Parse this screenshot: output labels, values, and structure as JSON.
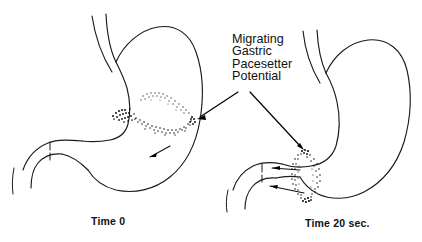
{
  "figure": {
    "name": "migrating-gastric-pacesetter-potential",
    "background_color": "#ffffff",
    "ink_color": "#111111",
    "width": 422,
    "height": 242
  },
  "annotation": {
    "lines": [
      "Migrating",
      "Gastric",
      "Pacesetter",
      "Potential"
    ],
    "line1": "Migrating",
    "line2": "Gastric",
    "line3": "Pacesetter",
    "line4": "Potential",
    "x": 232,
    "y_start": 43,
    "line_height": 12.4
  },
  "captions": {
    "left": "Time 0",
    "right": "Time 20 sec."
  },
  "panels": [
    {
      "id": "panel-time-0",
      "caption": "Time 0",
      "band_orientation": "oblique",
      "band_center_x": 159,
      "band_center_y": 120,
      "description": "Stomach at time zero with stippled pacesetter potential band in the proximal body"
    },
    {
      "id": "panel-time-20",
      "caption": "Time 20 sec.",
      "band_orientation": "vertical",
      "band_center_x": 308,
      "band_center_y": 176,
      "description": "Stomach at twenty seconds with stippled pacesetter potential ring migrated to the antrum"
    }
  ],
  "leader_arrows": [
    {
      "name": "leader-arrow-left",
      "from_x": 238,
      "from_y": 92,
      "to_x": 197,
      "to_y": 119
    },
    {
      "name": "leader-arrow-right",
      "from_x": 250,
      "from_y": 92,
      "to_x": 304,
      "to_y": 150
    }
  ]
}
